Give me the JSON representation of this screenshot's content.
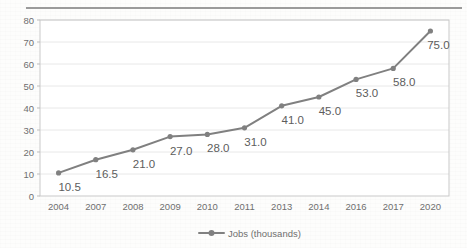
{
  "figure": {
    "top_rule": "horizontal-rule",
    "background_color": "#fdfdfc"
  },
  "chart_data": {
    "type": "line",
    "title": "",
    "subtitle": "",
    "xlabel": "",
    "ylabel": "",
    "categories": [
      "2004",
      "2007",
      "2008",
      "2009",
      "2010",
      "2011",
      "2013",
      "2014",
      "2016",
      "2017",
      "2020"
    ],
    "values": [
      10.5,
      16.5,
      21.0,
      27.0,
      28.0,
      31.0,
      41.0,
      45.0,
      53.0,
      58.0,
      75.0
    ],
    "point_labels": [
      "10.5",
      "16.5",
      "21.0",
      "27.0",
      "28.0",
      "31.0",
      "41.0",
      "45.0",
      "53.0",
      "58.0",
      "75.0"
    ],
    "series": [
      {
        "name": "Jobs (thousands)",
        "values": [
          10.5,
          16.5,
          21.0,
          27.0,
          28.0,
          31.0,
          41.0,
          45.0,
          53.0,
          58.0,
          75.0
        ],
        "color": "#808080",
        "marker": "circle",
        "show_labels": true
      }
    ],
    "ylim": [
      0,
      80
    ],
    "ytick_step": 10,
    "ytick_labels": [
      "0",
      "10",
      "20",
      "30",
      "40",
      "50",
      "60",
      "70",
      "80"
    ],
    "grid": true,
    "grid_axis": "y",
    "grid_color": "#e8e8e8",
    "plot_border_color": "#c9c9c9",
    "legend_position": "bottom",
    "legend": [
      {
        "label": "Jobs (thousands)",
        "color": "#808080",
        "marker": "circle-with-line"
      }
    ]
  }
}
